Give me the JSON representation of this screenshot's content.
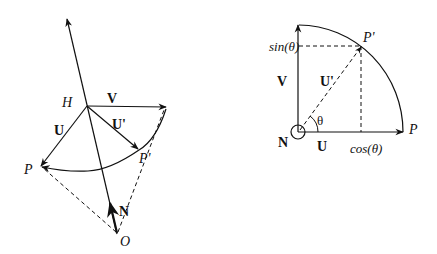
{
  "left_diagram": {
    "labels": {
      "H": "H",
      "V": "V",
      "U": "U",
      "U_prime": "U'",
      "P": "P",
      "P_prime": "P'",
      "N": "N",
      "O": "O"
    }
  },
  "right_diagram": {
    "labels": {
      "sin": "sin(θ)",
      "cos": "cos(θ)",
      "V": "V",
      "U": "U",
      "U_prime": "U'",
      "theta": "θ",
      "N": "N",
      "P": "P",
      "P_prime": "P'"
    }
  },
  "colors": {
    "stroke": "#111111",
    "background": "#ffffff"
  }
}
